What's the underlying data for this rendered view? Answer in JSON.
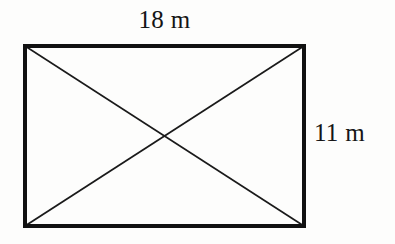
{
  "figure": {
    "background_color": "#fdfdfc",
    "stroke_color": "#111111",
    "text_color": "#151515",
    "labels": {
      "width": "18 m",
      "height": "11 m"
    },
    "shape": {
      "type": "rectangle",
      "left": 25,
      "top": 46,
      "right": 304,
      "bottom": 226,
      "width_px": 279,
      "height_px": 180,
      "border_width_px": 3,
      "diagonal_width_px": 1.6,
      "diagonals": [
        {
          "name": "diagonal-top-left-to-bottom-right",
          "x1": 25,
          "y1": 46,
          "x2": 304,
          "y2": 226
        },
        {
          "name": "diagonal-bottom-left-to-top-right",
          "x1": 25,
          "y1": 226,
          "x2": 304,
          "y2": 46
        }
      ],
      "center": {
        "x": 164,
        "y": 136
      }
    },
    "measurements": {
      "width_value": "18",
      "width_unit": "m",
      "height_value": "11",
      "height_unit": "m"
    }
  }
}
